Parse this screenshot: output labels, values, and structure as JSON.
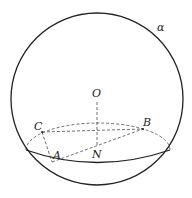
{
  "diagram": {
    "type": "sphere-geometry",
    "labels": {
      "alpha": "α",
      "O": "O",
      "C": "C",
      "B": "B",
      "A": "A",
      "N": "N"
    },
    "colors": {
      "stroke": "#222222",
      "background": "#ffffff"
    }
  }
}
